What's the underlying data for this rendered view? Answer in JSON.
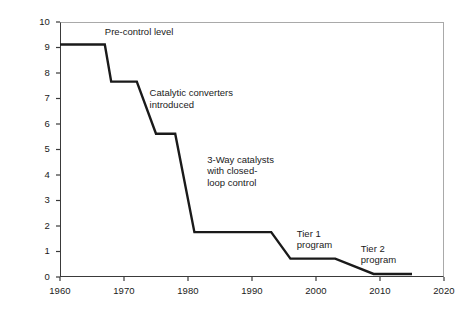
{
  "chart_data": {
    "type": "line",
    "title": "",
    "subtitle": "",
    "xlabel": "",
    "ylabel": "Health damage index (nominal cents/mile)",
    "xlim": [
      1960,
      2020
    ],
    "ylim": [
      0,
      10
    ],
    "xticks": [
      1960,
      1970,
      1980,
      1990,
      2000,
      2010,
      2020
    ],
    "yticks": [
      0,
      1,
      2,
      3,
      4,
      5,
      6,
      7,
      8,
      9,
      10
    ],
    "xtick_labels": [
      "1960",
      "1970",
      "1980",
      "1990",
      "2000",
      "2010",
      "2020"
    ],
    "ytick_labels": [
      "0",
      "1",
      "2",
      "3",
      "4",
      "5",
      "6",
      "7",
      "8",
      "9",
      "10"
    ],
    "grid": false,
    "legend": "none",
    "series": [
      {
        "name": "Health damage index",
        "color": "#1a1a1a",
        "x": [
          1960,
          1967,
          1968,
          1972,
          1975,
          1978,
          1981,
          1993,
          1996,
          2003,
          2009,
          2015
        ],
        "values": [
          9.12,
          9.12,
          7.66,
          7.66,
          5.62,
          5.62,
          1.76,
          1.76,
          0.72,
          0.72,
          0.12,
          0.12
        ]
      }
    ],
    "annotations": [
      {
        "id": "pre-control",
        "text": "Pre-control level",
        "x": 1967,
        "y": 9.6
      },
      {
        "id": "catalytic-converters",
        "text": "Catalytic converters\nintroduced",
        "x": 1974,
        "y": 7.2
      },
      {
        "id": "three-way-catalysts",
        "text": "3-Way catalysts\nwith closed-\nloop control",
        "x": 1983,
        "y": 4.6
      },
      {
        "id": "tier-1",
        "text": "Tier 1\nprogram",
        "x": 1997,
        "y": 1.7
      },
      {
        "id": "tier-2",
        "text": "Tier 2\nprogram",
        "x": 2007,
        "y": 1.1
      }
    ],
    "axis_color": "#3a3a3a",
    "frame_color": "#a9a9a9",
    "background": "#ffffff"
  }
}
